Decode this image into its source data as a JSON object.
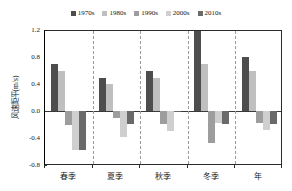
{
  "chart_data": {
    "type": "bar",
    "title": "",
    "subtitle": "",
    "xlabel": "",
    "ylabel": "风速距平(m/s)",
    "categories": [
      "春季",
      "夏季",
      "秋季",
      "冬季",
      "年"
    ],
    "series": [
      {
        "name": "1970s",
        "color": "#4d4d4d",
        "values": [
          0.7,
          0.5,
          0.6,
          1.2,
          0.81
        ]
      },
      {
        "name": "1980s",
        "color": "#bfbfbf",
        "values": [
          0.6,
          0.4,
          0.5,
          0.7,
          0.6
        ]
      },
      {
        "name": "1990s",
        "color": "#9d9d9d",
        "values": [
          -0.21,
          -0.11,
          -0.2,
          -0.49,
          -0.19
        ]
      },
      {
        "name": "2000s",
        "color": "#cfcfcf",
        "values": [
          -0.59,
          -0.4,
          -0.3,
          -0.18,
          -0.29
        ]
      },
      {
        "name": "2010s",
        "color": "#6a6a6a",
        "values": [
          -0.59,
          -0.2,
          -0.02,
          -0.2,
          -0.2
        ]
      }
    ],
    "ylim": [
      -0.8,
      1.2
    ],
    "yticks": [
      "1.2",
      "0.8",
      "0.4",
      "0.0",
      "-0.4",
      "-0.8"
    ],
    "ytick_values": [
      1.2,
      0.8,
      0.4,
      0.0,
      -0.4,
      -0.8
    ],
    "grid": false,
    "legend_position": "top",
    "zero_line": true,
    "group_dividers": true
  }
}
